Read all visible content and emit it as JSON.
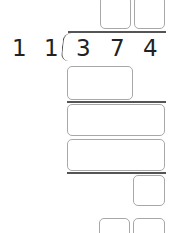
{
  "problem": {
    "divisor_digits": [
      "1",
      "1"
    ],
    "dividend_digits": [
      "3",
      "7",
      "4"
    ]
  },
  "answer_boxes": {
    "quotient": [
      "",
      ""
    ],
    "step1_product": "",
    "step1_difference": "",
    "step2_product": "",
    "remainder": "",
    "check": [
      "",
      ""
    ]
  }
}
